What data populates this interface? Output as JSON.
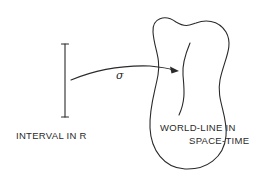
{
  "diagram": {
    "interval": {
      "label": "INTERVAL IN R"
    },
    "mapping": {
      "label": "σ"
    },
    "region": {
      "label_line1": "WORLD-LINE IN",
      "label_line2": "SPACE-TIME"
    },
    "colors": {
      "ink": "#2a2a2a",
      "background": "#ffffff"
    }
  }
}
